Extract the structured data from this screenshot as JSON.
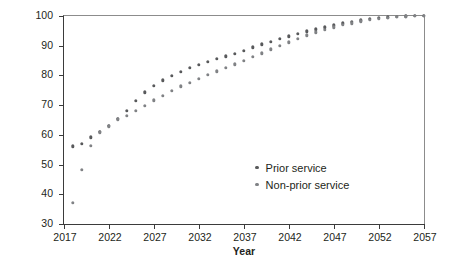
{
  "chart_data": {
    "type": "scatter",
    "title": "",
    "xlabel": "Year",
    "ylabel": "Percentage",
    "xlim": [
      2017,
      2057
    ],
    "ylim": [
      30,
      100
    ],
    "xticks": [
      "2017",
      "2022",
      "2027",
      "2032",
      "2037",
      "2042",
      "2047",
      "2052",
      "2057"
    ],
    "yticks": [
      "30",
      "40",
      "50",
      "60",
      "70",
      "80",
      "90",
      "100"
    ],
    "grid": false,
    "legend_position": "inside-lower-right",
    "marker_color": "#6d6e70",
    "series": [
      {
        "name": "Prior service",
        "color": "#58595b",
        "x": [
          2018,
          2019,
          2020,
          2021,
          2022,
          2023,
          2024,
          2025,
          2026,
          2027,
          2028,
          2029,
          2030,
          2031,
          2032,
          2033,
          2034,
          2035,
          2036,
          2037,
          2038,
          2039,
          2040,
          2041,
          2042,
          2043,
          2044,
          2045,
          2046,
          2047,
          2048,
          2049,
          2050,
          2051,
          2052,
          2053,
          2054,
          2055,
          2056,
          2057
        ],
        "values": [
          56.2,
          57.0,
          59.2,
          61.0,
          63.0,
          65.5,
          68.0,
          71.5,
          74.3,
          76.5,
          78.3,
          79.8,
          81.3,
          82.5,
          83.6,
          84.6,
          85.6,
          86.5,
          87.3,
          88.2,
          89.5,
          90.5,
          91.4,
          92.3,
          93.2,
          94.0,
          94.8,
          95.5,
          96.2,
          96.9,
          97.5,
          98.0,
          98.5,
          99.0,
          99.3,
          99.6,
          99.8,
          99.9,
          100.0,
          100.0
        ]
      },
      {
        "name": "Non-prior service",
        "color": "#808285",
        "x": [
          2018,
          2019,
          2020,
          2021,
          2022,
          2023,
          2024,
          2025,
          2026,
          2027,
          2028,
          2029,
          2030,
          2031,
          2032,
          2033,
          2034,
          2035,
          2036,
          2037,
          2038,
          2039,
          2040,
          2041,
          2042,
          2043,
          2044,
          2045,
          2046,
          2047,
          2048,
          2049,
          2050,
          2051,
          2052,
          2053,
          2054,
          2055,
          2056,
          2057
        ],
        "values": [
          37.2,
          48.2,
          56.3,
          60.8,
          62.9,
          65.2,
          66.5,
          68.0,
          69.8,
          71.6,
          73.2,
          74.8,
          76.3,
          77.6,
          78.8,
          80.2,
          81.4,
          82.6,
          83.8,
          84.9,
          86.2,
          87.5,
          88.8,
          90.0,
          91.2,
          92.4,
          93.5,
          94.5,
          95.4,
          96.2,
          97.0,
          97.6,
          98.2,
          98.7,
          99.1,
          99.4,
          99.7,
          99.9,
          100.0,
          100.0
        ]
      }
    ]
  }
}
